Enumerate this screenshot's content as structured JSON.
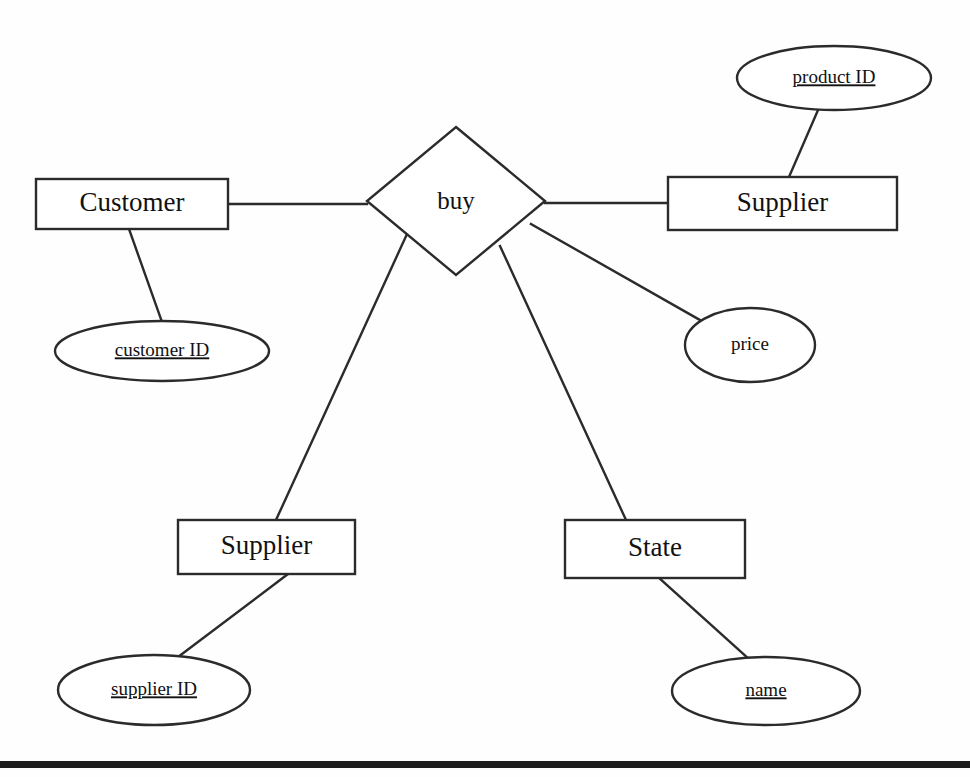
{
  "diagram": {
    "kind": "entity-relationship-diagram",
    "title": "",
    "canvas": {
      "width": 970,
      "height": 777
    },
    "colors": {
      "background": "#fefefe",
      "stroke": "#2b2b2b",
      "text": "#111111",
      "shape_fill": "#ffffff",
      "rule": "#1c1c1c"
    },
    "entities": [
      {
        "id": "customer",
        "label": "Customer",
        "shape": "rectangle",
        "x": 36,
        "y": 179,
        "width": 192,
        "height": 50
      },
      {
        "id": "supplier_top",
        "label": "Supplier",
        "shape": "rectangle",
        "x": 668,
        "y": 177,
        "width": 229,
        "height": 53
      },
      {
        "id": "supplier_bottom",
        "label": "Supplier",
        "shape": "rectangle",
        "x": 178,
        "y": 520,
        "width": 177,
        "height": 54
      },
      {
        "id": "state",
        "label": "State",
        "shape": "rectangle",
        "x": 565,
        "y": 520,
        "width": 180,
        "height": 58
      }
    ],
    "relationships": [
      {
        "id": "buy",
        "label": "buy",
        "shape": "diamond",
        "cx": 456,
        "cy": 201,
        "rx": 89,
        "ry": 74
      }
    ],
    "attributes": [
      {
        "id": "customer_id",
        "label": "customer ID",
        "shape": "ellipse",
        "key": true,
        "cx": 162,
        "cy": 351,
        "rx": 107,
        "ry": 30
      },
      {
        "id": "product_id",
        "label": "product ID",
        "shape": "ellipse",
        "key": true,
        "cx": 834,
        "cy": 78,
        "rx": 97,
        "ry": 32
      },
      {
        "id": "price",
        "label": "price",
        "shape": "ellipse",
        "key": false,
        "cx": 750,
        "cy": 345,
        "rx": 65,
        "ry": 37
      },
      {
        "id": "supplier_id",
        "label": "supplier ID",
        "shape": "ellipse",
        "key": true,
        "cx": 154,
        "cy": 690,
        "rx": 96,
        "ry": 35
      },
      {
        "id": "name",
        "label": "name",
        "shape": "ellipse",
        "key": true,
        "cx": 766,
        "cy": 691,
        "rx": 94,
        "ry": 34
      }
    ],
    "connections": [
      {
        "id": "customer-to-buy",
        "from": "customer",
        "to": "buy",
        "points": "228,204 367,204"
      },
      {
        "id": "buy-to-supplier-top",
        "from": "buy",
        "to": "supplier_top",
        "points": "545,203 668,203"
      },
      {
        "id": "customer-to-customer-id",
        "from": "customer",
        "to": "customer_id",
        "points": "129,229 162,322"
      },
      {
        "id": "supplier-top-to-product-id",
        "from": "supplier_top",
        "to": "product_id",
        "points": "789,177 818,110"
      },
      {
        "id": "buy-to-price",
        "from": "buy",
        "to": "price",
        "points": "531,224 700,320"
      },
      {
        "id": "buy-to-supplier-bottom",
        "from": "buy",
        "to": "supplier_bottom",
        "points": "407,234 276,520"
      },
      {
        "id": "buy-to-state",
        "from": "buy",
        "to": "state",
        "points": "500,246 626,520"
      },
      {
        "id": "supplier-bottom-to-supplier-id",
        "from": "supplier_bottom",
        "to": "supplier_id",
        "points": "288,574 178,657"
      },
      {
        "id": "state-to-name",
        "from": "state",
        "to": "name",
        "points": "659,578 749,659"
      }
    ],
    "bottom_rule": {
      "x": 0,
      "y": 761,
      "width": 970,
      "height": 7
    }
  }
}
